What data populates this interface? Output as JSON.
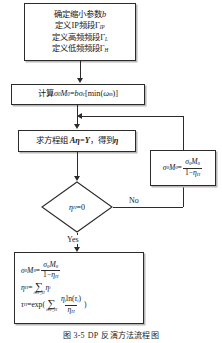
{
  "figure": {
    "caption_number": "图 3-5",
    "caption_tag": "DP",
    "caption_text": "反演方法流程图"
  },
  "nodes": {
    "init": {
      "name": "initialization-box",
      "lines": [
        "确定缩小参数 b",
        "定义 IP 频段 Γ_IP",
        "定义高频频段 Γ_L",
        "定义低频频段 Γ_H"
      ],
      "line1_text": "确定缩小参数",
      "line1_var": "b",
      "line2_text": "定义IP频段",
      "line2_var": "Γ",
      "line2_sub": "IP",
      "line3_text": "定义高频频段",
      "line3_var": "Γ",
      "line3_sub": "L",
      "line4_text": "定义低频频段",
      "line4_var": "Γ",
      "line4_sub": "H"
    },
    "compute": {
      "name": "compute-sigma-box",
      "label": "计算",
      "formula": "σ₀M₀ = bσ_c[min(ω_m)]",
      "lhs_sigma": "σ",
      "lhs_sigma_sub": "0",
      "lhs_m": "M",
      "lhs_m_sub": "0",
      "eq": "=",
      "rhs_b": "b",
      "rhs_sigma": "σ",
      "rhs_sigma_sub": "c",
      "rhs_bracket_open": "[min(",
      "rhs_omega": "ω",
      "rhs_omega_sub": "m",
      "rhs_bracket_close": ")]"
    },
    "solve": {
      "name": "solve-equations-box",
      "prefix": "求方程组",
      "matrix": "A",
      "eta": "η",
      "equals": "=",
      "rhs": "Y",
      "comma": "，",
      "suffix": "得到",
      "result": "η",
      "full_text": "求方程组 Aη=Y，得到 η"
    },
    "update": {
      "name": "update-sigma-box",
      "formula": "σ₀M₀ = σ₀M₀ / (1 − η_H)",
      "lhs_sigma": "σ",
      "lhs_sigma_sub": "0",
      "lhs_m": "M",
      "lhs_m_sub": "0",
      "eq": "=",
      "num_sigma": "σ",
      "num_sigma_sub": "0",
      "num_m": "M",
      "num_m_sub": "0",
      "den_one": "1−",
      "den_eta": "η",
      "den_eta_sub": "H"
    },
    "decision": {
      "name": "decision-eta-zero",
      "variable": "η",
      "subscript": "H",
      "operator": "=",
      "value": "0",
      "text": "η_H = 0"
    },
    "final": {
      "name": "final-results-box",
      "eq1": {
        "lhs_sigma": "σ",
        "lhs_sigma_sub": "0",
        "lhs_m": "M",
        "lhs_m_sub": "0",
        "eq": "=",
        "num_sigma": "σ",
        "num_sigma_sub": "0",
        "num_m": "M",
        "num_m_sub": "0",
        "den_one": "1−",
        "den_eta": "η",
        "den_eta_sub": "H",
        "text": "σ₀M₀ = σ₀M₀ / (1 − η_H)"
      },
      "eq2": {
        "lhs_eta": "η",
        "lhs_eta_sub": "H",
        "eq": "=",
        "sum_glyph": "∑",
        "sum_limit": "i∈Γ_H",
        "term_eta": "η",
        "term_eta_sub": "i",
        "text": "η_H = Σ_{i∈Γ_H} η_i"
      },
      "eq3": {
        "lhs_tau": "τ",
        "lhs_tau_sub": "H",
        "eq": "=",
        "fn": "exp(",
        "sum_glyph": "∑",
        "sum_limit": "i∈Γ_H",
        "num_eta": "η",
        "num_eta_sub": "i",
        "num_ln": "ln(",
        "num_tau": "τ",
        "num_tau_sub": "i",
        "num_close": ")",
        "den_eta": "η",
        "den_eta_sub": "H",
        "close": ")",
        "text": "τ_H = exp( Σ_{i∈Γ_H} η_i ln(τ_i) / η_H )"
      }
    }
  },
  "edges": {
    "no_label": "No",
    "yes_label": "Yes"
  },
  "colors": {
    "stroke": "#2b2b2b",
    "background": "#ffffff",
    "shadow": "#b8b8b8",
    "text": "#161616"
  }
}
